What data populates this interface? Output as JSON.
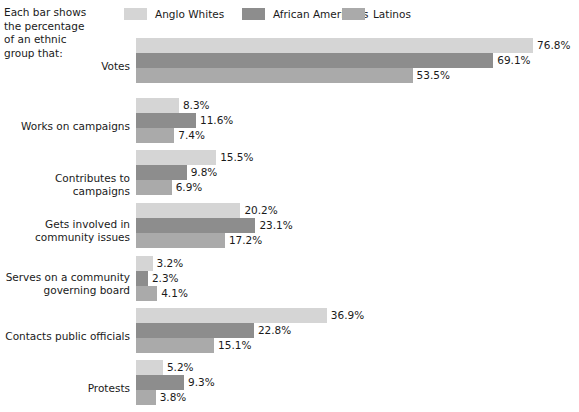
{
  "caption": "Each bar shows\nthe percentage\nof an ethnic\ngroup that:",
  "legend": {
    "items": [
      {
        "label": "Anglo Whites",
        "color": "#d5d5d5",
        "x": 0
      },
      {
        "label": "African Americans",
        "color": "#8d8d8d",
        "x": 118
      },
      {
        "label": "Latinos",
        "color": "#aaaaaa",
        "x": 218
      }
    ]
  },
  "chart_data": {
    "type": "bar",
    "orientation": "horizontal",
    "title": "",
    "xlabel": "",
    "ylabel": "",
    "xlim": [
      0,
      76.8
    ],
    "grid": false,
    "value_suffix": "%",
    "legend_position": "top",
    "categories": [
      "Votes",
      "Works on campaigns",
      "Contributes to campaigns",
      "Gets involved in\ncommunity issues",
      "Serves on a community\ngoverning board",
      "Contacts public officials",
      "Protests"
    ],
    "series": [
      {
        "name": "Anglo Whites",
        "color": "#d5d5d5",
        "values": [
          76.8,
          8.3,
          15.5,
          20.2,
          3.2,
          36.9,
          5.2
        ],
        "labels": [
          "76.8%",
          "8.3%",
          "15.5%",
          "20.2%",
          "3.2%",
          "36.9%",
          "5.2%"
        ]
      },
      {
        "name": "African Americans",
        "color": "#8d8d8d",
        "values": [
          69.1,
          11.6,
          9.8,
          23.1,
          2.3,
          22.8,
          9.3
        ],
        "labels": [
          "69.1%",
          "11.6%",
          "9.8%",
          "23.1%",
          "2.3%",
          "22.8%",
          "9.3%"
        ]
      },
      {
        "name": "Latinos",
        "color": "#aaaaaa",
        "values": [
          53.5,
          7.4,
          6.9,
          17.2,
          4.1,
          15.1,
          3.8
        ],
        "labels": [
          "53.5%",
          "7.4%",
          "6.9%",
          "17.2%",
          "4.1%",
          "15.1%",
          "3.8%"
        ]
      }
    ]
  },
  "layout": {
    "bar_origin_x": 136,
    "px_per_percent": 5.17,
    "bar_height": 15,
    "group_tops": [
      38,
      98,
      150,
      203,
      256,
      308,
      360
    ],
    "label_mid_offsets": [
      22,
      22,
      22,
      15,
      15,
      22,
      22
    ]
  }
}
